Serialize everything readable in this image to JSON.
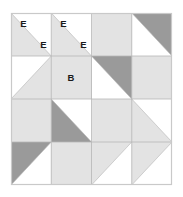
{
  "figure": {
    "name": "quilt-block-diagram",
    "type": "half-square-triangle-grid",
    "rows": 4,
    "cols": 4,
    "frame": {
      "x": 11,
      "y": 13,
      "width": 161,
      "height": 172
    },
    "cell": {
      "width": 40.25,
      "height": 43.0
    }
  },
  "colors": {
    "background": "#ffffff",
    "light_gray": "#e3e3e3",
    "dark_gray": "#9a9a9a",
    "grid_line": "#b6b6b6",
    "outer_border": "#c9c9c9",
    "label_text": "#1a1a1a"
  },
  "cells": [
    {
      "row": 0,
      "col": 0,
      "fill": "half",
      "shade": "light_gray",
      "orientation": "lower-left"
    },
    {
      "row": 0,
      "col": 1,
      "fill": "half",
      "shade": "light_gray",
      "orientation": "lower-left"
    },
    {
      "row": 0,
      "col": 2,
      "fill": "full",
      "shade": "light_gray",
      "orientation": "none"
    },
    {
      "row": 0,
      "col": 3,
      "fill": "half",
      "shade": "dark_gray",
      "orientation": "upper-right"
    },
    {
      "row": 1,
      "col": 0,
      "fill": "half",
      "shade": "light_gray",
      "orientation": "lower-right"
    },
    {
      "row": 1,
      "col": 1,
      "fill": "full",
      "shade": "light_gray",
      "orientation": "none"
    },
    {
      "row": 1,
      "col": 2,
      "fill": "half",
      "shade": "dark_gray",
      "orientation": "upper-right"
    },
    {
      "row": 1,
      "col": 3,
      "fill": "full",
      "shade": "light_gray",
      "orientation": "none"
    },
    {
      "row": 2,
      "col": 0,
      "fill": "full",
      "shade": "light_gray",
      "orientation": "none"
    },
    {
      "row": 2,
      "col": 1,
      "fill": "half",
      "shade": "dark_gray",
      "orientation": "lower-left"
    },
    {
      "row": 2,
      "col": 2,
      "fill": "full",
      "shade": "light_gray",
      "orientation": "none"
    },
    {
      "row": 2,
      "col": 3,
      "fill": "half",
      "shade": "light_gray",
      "orientation": "lower-left"
    },
    {
      "row": 3,
      "col": 0,
      "fill": "half",
      "shade": "dark_gray",
      "orientation": "upper-left"
    },
    {
      "row": 3,
      "col": 1,
      "fill": "full",
      "shade": "light_gray",
      "orientation": "none"
    },
    {
      "row": 3,
      "col": 2,
      "fill": "half",
      "shade": "light_gray",
      "orientation": "upper-left"
    },
    {
      "row": 3,
      "col": 3,
      "fill": "half",
      "shade": "light_gray",
      "orientation": "upper-left"
    }
  ],
  "labels": [
    {
      "text": "E",
      "x": 23.5,
      "y": 24.5
    },
    {
      "text": "E",
      "x": 43.5,
      "y": 45.5
    },
    {
      "text": "E",
      "x": 63.5,
      "y": 24.5
    },
    {
      "text": "E",
      "x": 83.5,
      "y": 45.5
    },
    {
      "text": "B",
      "x": 71.0,
      "y": 78.5
    }
  ]
}
